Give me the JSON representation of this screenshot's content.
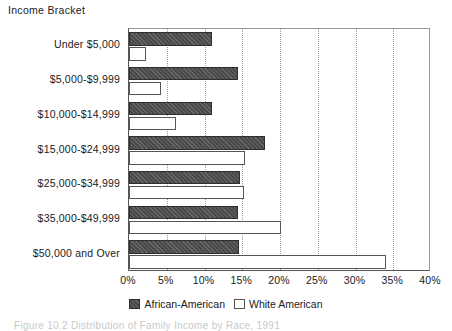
{
  "chart_data": {
    "type": "bar",
    "orientation": "horizontal",
    "title": "",
    "axis_title": "Income Bracket",
    "xlabel": "",
    "ylabel": "Income Bracket",
    "xlim": [
      0,
      40
    ],
    "xtick_labels": [
      "0%",
      "5%",
      "10%",
      "15%",
      "20%",
      "25%",
      "30%",
      "35%",
      "40%"
    ],
    "xticks": [
      0,
      5,
      10,
      15,
      20,
      25,
      30,
      35,
      40
    ],
    "grid": true,
    "grid_axis": "x",
    "legend_position": "bottom",
    "categories": [
      "Under $5,000",
      "$5,000-$9,999",
      "$10,000-$14,999",
      "$15,000-$24,999",
      "$25,000-$34,999",
      "$35,000-$49,999",
      "$50,000 and Over"
    ],
    "series": [
      {
        "name": "African-American",
        "color": "#4a4a4a",
        "values": [
          11.0,
          14.5,
          11.0,
          18.0,
          14.7,
          14.4,
          14.6
        ]
      },
      {
        "name": "White American",
        "color": "#ffffff",
        "values": [
          2.3,
          4.3,
          6.2,
          15.4,
          15.2,
          20.1,
          34.0
        ]
      }
    ]
  },
  "legend": {
    "items": [
      {
        "label": "African-American",
        "swatch": "filled-square-icon"
      },
      {
        "label": "White American",
        "swatch": "outlined-square-icon"
      }
    ]
  },
  "caption": {
    "text": "Figure 10.2  Distribution of Family Income by Race, 1991"
  }
}
